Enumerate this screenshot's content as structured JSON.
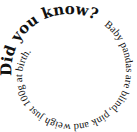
{
  "spiral": {
    "heading": "Did you know?",
    "body": "Baby pandas are blind, pink and weigh just 100g at birth.",
    "text_color": "#111111",
    "background": "#ffffff"
  }
}
